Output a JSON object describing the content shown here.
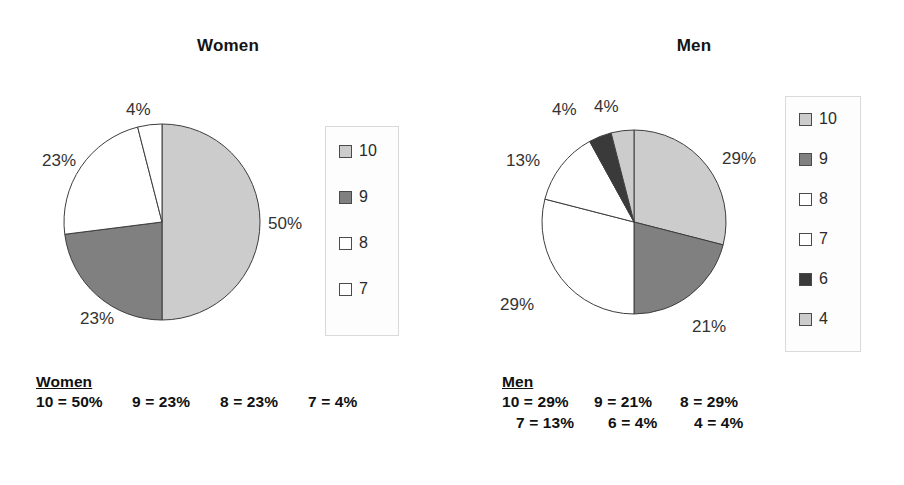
{
  "chart_data": [
    {
      "type": "pie",
      "title": "Women",
      "categories": [
        "10",
        "9",
        "8",
        "7"
      ],
      "values": [
        50,
        23,
        23,
        4
      ],
      "value_labels": [
        "50%",
        "23%",
        "23%",
        "4%"
      ],
      "colors": [
        "#cccccc",
        "#808080",
        "#ffffff",
        "#ffffff"
      ],
      "legend_position": "right",
      "start_angle_deg": 0,
      "direction": "clockwise",
      "units": "percent"
    },
    {
      "type": "pie",
      "title": "Men",
      "categories": [
        "10",
        "9",
        "8",
        "7",
        "6",
        "4"
      ],
      "values": [
        29,
        21,
        29,
        13,
        4,
        4
      ],
      "value_labels": [
        "29%",
        "21%",
        "29%",
        "13%",
        "4%",
        "4%"
      ],
      "colors": [
        "#cccccc",
        "#808080",
        "#ffffff",
        "#ffffff",
        "#3a3a3a",
        "#cccccc"
      ],
      "legend_position": "right",
      "start_angle_deg": 0,
      "direction": "clockwise",
      "units": "percent"
    }
  ],
  "women": {
    "title": "Women",
    "slice_labels": [
      {
        "text": "50%",
        "x": 268,
        "y": 215
      },
      {
        "text": "23%",
        "x": 80,
        "y": 310
      },
      {
        "text": "23%",
        "x": 42,
        "y": 152
      },
      {
        "text": "4%",
        "x": 126,
        "y": 101
      }
    ],
    "legend": {
      "items": [
        {
          "label": "10",
          "color": "#cccccc"
        },
        {
          "label": "9",
          "color": "#808080"
        },
        {
          "label": "8",
          "color": "#ffffff"
        },
        {
          "label": "7",
          "color": "#ffffff"
        }
      ]
    },
    "caption": {
      "heading": "Women",
      "entries": [
        "10 = 50%",
        "9 = 23%",
        "8 = 23%",
        "7 = 4%"
      ]
    }
  },
  "men": {
    "title": "Men",
    "slice_labels": [
      {
        "text": "29%",
        "x": 722,
        "y": 150
      },
      {
        "text": "21%",
        "x": 692,
        "y": 318
      },
      {
        "text": "29%",
        "x": 500,
        "y": 296
      },
      {
        "text": "13%",
        "x": 506,
        "y": 152
      },
      {
        "text": "4%",
        "x": 552,
        "y": 101
      },
      {
        "text": "4%",
        "x": 594,
        "y": 98
      }
    ],
    "legend": {
      "items": [
        {
          "label": "10",
          "color": "#cccccc"
        },
        {
          "label": "9",
          "color": "#808080"
        },
        {
          "label": "8",
          "color": "#ffffff"
        },
        {
          "label": "7",
          "color": "#ffffff"
        },
        {
          "label": "6",
          "color": "#3a3a3a"
        },
        {
          "label": "4",
          "color": "#cccccc"
        }
      ]
    },
    "caption": {
      "heading": "Men",
      "entries_row1": [
        "10 = 29%",
        "9 = 21%",
        "8 = 29%"
      ],
      "entries_row2": [
        "7 = 13%",
        "6 = 4%",
        "4 = 4%"
      ]
    }
  }
}
